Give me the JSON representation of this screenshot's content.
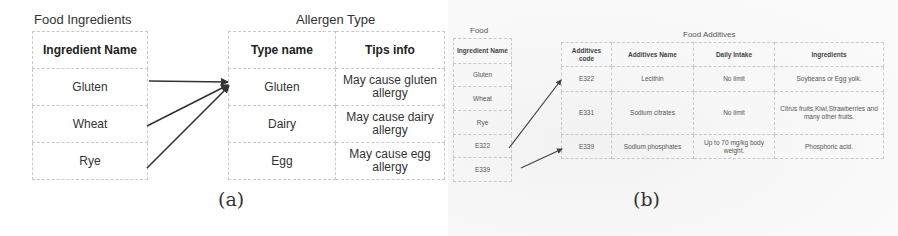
{
  "panel_a": {
    "caption": "(a)",
    "ingredients_table": {
      "title": "Food Ingredients",
      "header": "Ingredient Name",
      "rows": [
        "Gluten",
        "Wheat",
        "Rye"
      ]
    },
    "allergen_table": {
      "title": "Allergen Type",
      "headers": [
        "Type name",
        "Tips info"
      ],
      "rows": [
        [
          "Gluten",
          "May cause gluten allergy"
        ],
        [
          "Dairy",
          "May cause dairy allergy"
        ],
        [
          "Egg",
          "May cause egg allergy"
        ]
      ]
    },
    "links": [
      {
        "from": "Gluten",
        "to": "Gluten"
      },
      {
        "from": "Wheat",
        "to": "Gluten"
      },
      {
        "from": "Rye",
        "to": "Gluten"
      }
    ]
  },
  "panel_b": {
    "caption": "(b)",
    "food_table": {
      "title": "Food",
      "header": "Ingredient Name",
      "rows": [
        "Gluten",
        "Wheat",
        "Rye",
        "E322",
        "E339"
      ]
    },
    "additives_table": {
      "title": "Food Additives",
      "headers": [
        "Additives code",
        "Additives Name",
        "Daily Intake",
        "Ingredients"
      ],
      "rows": [
        [
          "E322",
          "Lecithin",
          "No limit",
          "Soybeans or Egg yolk."
        ],
        [
          "E331",
          "Sodium citrates",
          "No limit",
          "Citrus fruits,Kiwi,Strawberries and many other fruits."
        ],
        [
          "E339",
          "Sodium phosphates",
          "Up to 70 mg/kg body weight.",
          "Phosphoric acid."
        ]
      ]
    },
    "links": [
      {
        "from": "E322",
        "to": "E322"
      },
      {
        "from": "E339",
        "to": "E339"
      }
    ]
  },
  "colors": {
    "border": "#c9c9c9",
    "arrow": "#333333",
    "text": "#333333"
  }
}
